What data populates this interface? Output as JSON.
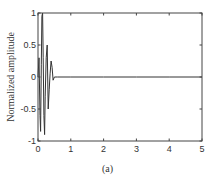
{
  "chart_data": {
    "type": "line",
    "title": "",
    "xlabel": "",
    "ylabel": "Normalized amplitude",
    "caption": "(a)",
    "xlim": [
      0,
      5
    ],
    "ylim": [
      -1,
      1
    ],
    "xticks": [
      "0",
      "1",
      "2",
      "3",
      "4",
      "5"
    ],
    "yticks": [
      "1",
      "0.5",
      "0",
      "-0.5",
      "-1"
    ],
    "grid": false,
    "legend": null,
    "series": [
      {
        "name": "waveform",
        "color": "#333333",
        "x": [
          0.0,
          0.03,
          0.06,
          0.08,
          0.1,
          0.12,
          0.14,
          0.16,
          0.18,
          0.2,
          0.22,
          0.25,
          0.28,
          0.31,
          0.34,
          0.37,
          0.4,
          0.43,
          0.46,
          0.5,
          0.6,
          1.0,
          2.0,
          3.0,
          4.0,
          5.0
        ],
        "y": [
          0.0,
          0.3,
          -0.6,
          -0.85,
          0.2,
          0.95,
          1.0,
          0.3,
          -0.6,
          -0.9,
          -0.3,
          0.3,
          0.5,
          -0.5,
          -0.2,
          0.05,
          0.25,
          0.15,
          -0.05,
          0.0,
          0.0,
          0.0,
          0.0,
          0.0,
          0.0,
          0.0
        ]
      }
    ]
  }
}
